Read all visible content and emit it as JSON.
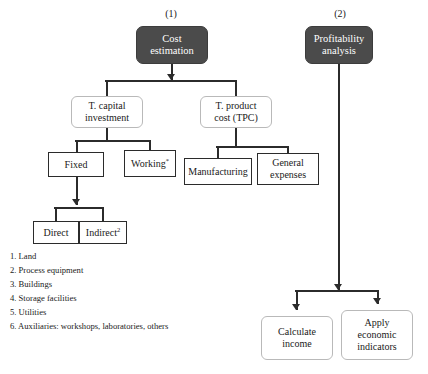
{
  "diagram": {
    "group_labels": [
      {
        "text": "(1)",
        "x": 141,
        "y": 8
      },
      {
        "text": "(2)",
        "x": 310,
        "y": 8
      }
    ],
    "nodes": [
      {
        "id": "cost-estimation",
        "name": "node-cost-estimation",
        "style": "dark",
        "lines": [
          "Cost",
          "estimation"
        ],
        "x": 136,
        "y": 26,
        "w": 72,
        "h": 38
      },
      {
        "id": "profitability",
        "name": "node-profitability-analysis",
        "style": "dark",
        "lines": [
          "Profitability",
          "analysis"
        ],
        "x": 305,
        "y": 26,
        "w": 68,
        "h": 38
      },
      {
        "id": "capital-investment",
        "name": "node-total-capital-investment",
        "style": "soft",
        "lines": [
          "T. capital",
          "investment"
        ],
        "x": 71,
        "y": 96,
        "w": 72,
        "h": 32
      },
      {
        "id": "product-cost",
        "name": "node-total-product-cost",
        "style": "soft",
        "lines": [
          "T. product",
          "cost (TPC)"
        ],
        "x": 200,
        "y": 96,
        "w": 72,
        "h": 32
      },
      {
        "id": "fixed",
        "name": "node-fixed",
        "style": "sharp",
        "lines": [
          "Fixed"
        ],
        "x": 48,
        "y": 152,
        "w": 56,
        "h": 25
      },
      {
        "id": "working",
        "name": "node-working",
        "style": "sharp",
        "lines": [
          "Working"
        ],
        "sup": "*",
        "x": 124,
        "y": 150,
        "w": 52,
        "h": 27
      },
      {
        "id": "manufacturing",
        "name": "node-manufacturing",
        "style": "sharp",
        "lines": [
          "Manufacturing"
        ],
        "x": 184,
        "y": 158,
        "w": 68,
        "h": 27
      },
      {
        "id": "general-expenses",
        "name": "node-general-expenses",
        "style": "sharp",
        "lines": [
          "General",
          "expenses"
        ],
        "x": 257,
        "y": 153,
        "w": 62,
        "h": 32
      },
      {
        "id": "direct",
        "name": "node-direct",
        "style": "sharp",
        "lines": [
          "Direct"
        ],
        "x": 33,
        "y": 221,
        "w": 46,
        "h": 23
      },
      {
        "id": "indirect",
        "name": "node-indirect",
        "style": "sharp",
        "lines": [
          "Indirect"
        ],
        "sup": "2",
        "x": 79,
        "y": 221,
        "w": 48,
        "h": 23
      },
      {
        "id": "calculate-income",
        "name": "node-calculate-income",
        "style": "soft",
        "lines": [
          "Calculate",
          "income"
        ],
        "x": 261,
        "y": 316,
        "w": 72,
        "h": 44
      },
      {
        "id": "apply-indicators",
        "name": "node-apply-economic-indicators",
        "style": "soft",
        "lines": [
          "Apply",
          "economic",
          "indicators"
        ],
        "x": 341,
        "y": 310,
        "w": 72,
        "h": 50
      }
    ],
    "connectors": {
      "vlines": [
        {
          "name": "connector-cost-estimation-down",
          "x": 171,
          "y": 64,
          "h": 16
        },
        {
          "name": "connector-split1-left-drop",
          "x": 106,
          "y": 80,
          "h": 16
        },
        {
          "name": "connector-split1-right-drop",
          "x": 235,
          "y": 80,
          "h": 16
        },
        {
          "name": "connector-capital-investment-down",
          "x": 106,
          "y": 128,
          "h": 14
        },
        {
          "name": "connector-split2-left-drop",
          "x": 76,
          "y": 140,
          "h": 12
        },
        {
          "name": "connector-split2-right-drop",
          "x": 149,
          "y": 140,
          "h": 10
        },
        {
          "name": "connector-product-cost-down",
          "x": 235,
          "y": 128,
          "h": 20
        },
        {
          "name": "connector-split3-left-drop",
          "x": 217,
          "y": 146,
          "h": 12
        },
        {
          "name": "connector-split3-right-drop",
          "x": 287,
          "y": 146,
          "h": 7
        },
        {
          "name": "connector-fixed-down",
          "x": 76,
          "y": 177,
          "h": 28
        },
        {
          "name": "connector-split4-left-drop",
          "x": 55,
          "y": 207,
          "h": 14
        },
        {
          "name": "connector-split4-right-drop",
          "x": 102,
          "y": 207,
          "h": 14
        },
        {
          "name": "connector-profitability-down",
          "x": 338,
          "y": 64,
          "h": 226
        },
        {
          "name": "connector-split5-left-drop",
          "x": 296,
          "y": 290,
          "h": 20
        },
        {
          "name": "connector-split5-right-drop",
          "x": 377,
          "y": 290,
          "h": 14
        }
      ],
      "hlines": [
        {
          "name": "connector-split1-bar",
          "x": 105,
          "y": 80,
          "w": 132
        },
        {
          "name": "connector-split2-bar",
          "x": 75,
          "y": 140,
          "w": 76
        },
        {
          "name": "connector-split3-bar",
          "x": 216,
          "y": 146,
          "w": 73
        },
        {
          "name": "connector-split4-bar",
          "x": 54,
          "y": 207,
          "w": 50
        },
        {
          "name": "connector-split5-bar",
          "x": 295,
          "y": 290,
          "w": 84
        }
      ],
      "arrows": [
        {
          "name": "arrowhead-to-split1",
          "x": 167,
          "y": 74
        },
        {
          "name": "arrowhead-to-direct-split",
          "x": 72,
          "y": 199
        },
        {
          "name": "arrowhead-to-profitability-split",
          "x": 334,
          "y": 284
        },
        {
          "name": "arrowhead-to-calculate-income",
          "x": 292,
          "y": 304
        },
        {
          "name": "arrowhead-to-apply-indicators",
          "x": 373,
          "y": 298
        }
      ]
    },
    "legend": [
      "1. Land",
      "2. Process equipment",
      "3. Buildings",
      "4. Storage facilities",
      "5. Utilities",
      "6. Auxiliaries: workshops, laboratories, others"
    ]
  },
  "colors": {
    "dark_box_fill": "#4b4b4b",
    "dark_box_text": "#ffffff",
    "line": "#2b2b2b",
    "soft_border": "#b9b9b9",
    "sharp_border": "#2b2b2b",
    "background": "#ffffff",
    "text": "#1a1a1a"
  }
}
